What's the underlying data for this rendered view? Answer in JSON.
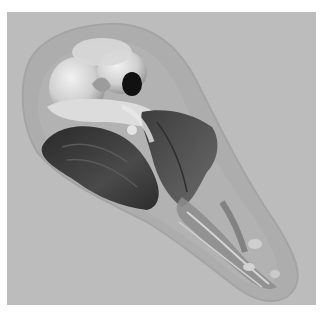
{
  "image": {
    "description": "3D volume rendering of an animal skull within a translucent head outline, grayscale",
    "background_color": "#bcbcbc",
    "frame_color": "#ffffff",
    "colors": {
      "outer_tissue": "#a9a9a9",
      "bone_light": "#e6e6e6",
      "bone_mid": "#bfbfbf",
      "dark_mass": "#3a3a3a",
      "dark_mass_2": "#4f4f4f",
      "cavity": "#111111"
    }
  }
}
